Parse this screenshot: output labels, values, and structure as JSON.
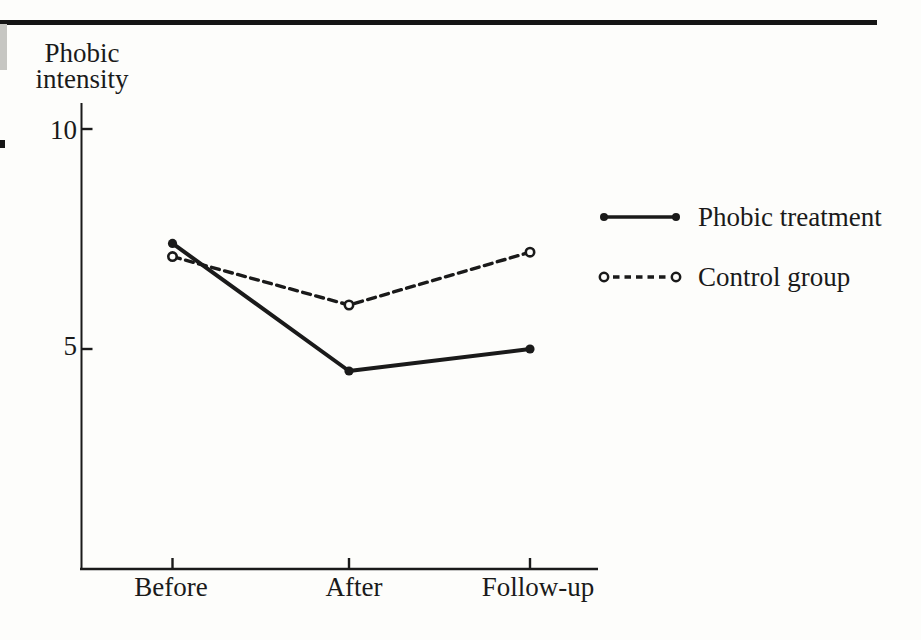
{
  "figure": {
    "y_axis_title": {
      "line1": "Phobic",
      "line2": "intensity"
    },
    "y_ticks": [
      {
        "label": "10",
        "value": 10
      },
      {
        "label": "5",
        "value": 5
      }
    ]
  },
  "legend": {
    "items": [
      {
        "label": "Phobic treatment",
        "style": "solid-filled-circle"
      },
      {
        "label": "Control group",
        "style": "dashed-open-circle"
      }
    ]
  },
  "chart_data": {
    "type": "line",
    "categories": [
      "Before",
      "After",
      "Follow-up"
    ],
    "series": [
      {
        "name": "Phobic treatment",
        "values": [
          7.4,
          4.5,
          5.0
        ],
        "line": "solid",
        "marker": "filled-circle"
      },
      {
        "name": "Control group",
        "values": [
          7.1,
          6.0,
          7.2
        ],
        "line": "dashed",
        "marker": "open-circle"
      }
    ],
    "ylabel": "Phobic intensity",
    "xlabel": "",
    "yticks": [
      5,
      10
    ],
    "ylim": [
      0,
      10.6
    ],
    "grid": false,
    "legend_position": "right"
  },
  "colors": {
    "ink": "#1a1a1a",
    "paper": "#fdfdfb",
    "page_edge_gray": "#c6c6c2"
  }
}
